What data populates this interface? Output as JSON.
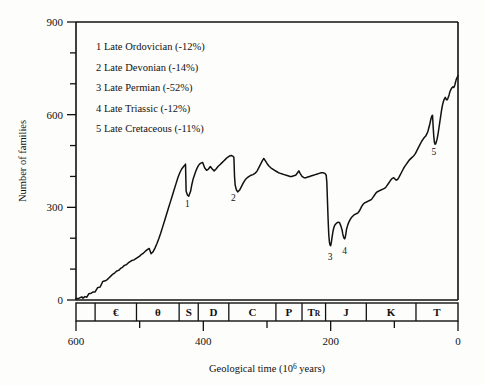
{
  "chart_data": {
    "type": "line",
    "title": "",
    "xlabel": "Geological time (10⁶ years)",
    "ylabel": "Number of families",
    "xlim": [
      600,
      0
    ],
    "ylim": [
      0,
      900
    ],
    "x_ticks": [
      600,
      500,
      400,
      300,
      200,
      100,
      0
    ],
    "x_tick_labels": [
      "600",
      "",
      "400",
      "",
      "200",
      "",
      "0"
    ],
    "x_tick_labels_major": [
      "600",
      "400",
      "200",
      "0"
    ],
    "y_ticks": [
      0,
      100,
      200,
      300,
      400,
      500,
      600,
      700,
      800,
      900
    ],
    "y_tick_labels_major": [
      "0",
      "300",
      "600",
      "900"
    ],
    "grid": false,
    "legend_position": "upper-left-inside",
    "series": [
      {
        "name": "Marine family diversity",
        "color": "#111111",
        "points": [
          [
            600,
            5
          ],
          [
            592,
            8
          ],
          [
            588,
            14
          ],
          [
            584,
            12
          ],
          [
            580,
            22
          ],
          [
            576,
            26
          ],
          [
            572,
            30
          ],
          [
            568,
            30
          ],
          [
            564,
            42
          ],
          [
            560,
            44
          ],
          [
            556,
            62
          ],
          [
            552,
            64
          ],
          [
            548,
            70
          ],
          [
            544,
            80
          ],
          [
            540,
            86
          ],
          [
            536,
            92
          ],
          [
            532,
            98
          ],
          [
            528,
            102
          ],
          [
            524,
            110
          ],
          [
            520,
            112
          ],
          [
            516,
            120
          ],
          [
            512,
            124
          ],
          [
            508,
            130
          ],
          [
            504,
            132
          ],
          [
            500,
            136
          ],
          [
            496,
            140
          ],
          [
            492,
            148
          ],
          [
            488,
            152
          ],
          [
            484,
            158
          ],
          [
            480,
            163
          ],
          [
            476,
            150
          ],
          [
            472,
            156
          ],
          [
            468,
            166
          ],
          [
            464,
            180
          ],
          [
            460,
            196
          ],
          [
            456,
            214
          ],
          [
            452,
            232
          ],
          [
            448,
            252
          ],
          [
            444,
            272
          ],
          [
            440,
            292
          ],
          [
            436,
            312
          ],
          [
            432,
            332
          ],
          [
            428,
            352
          ],
          [
            424,
            372
          ],
          [
            420,
            392
          ],
          [
            416,
            408
          ],
          [
            412,
            420
          ],
          [
            440,
            292
          ],
          [
            408,
            428
          ],
          [
            438,
            300
          ],
          [
            404,
            436
          ],
          [
            400,
            440
          ],
          [
            438,
            304
          ]
        ]
      }
    ],
    "curve_path": [
      [
        600,
        4
      ],
      [
        595,
        6
      ],
      [
        591,
        10
      ],
      [
        589,
        6
      ],
      [
        586,
        11
      ],
      [
        583,
        9
      ],
      [
        580,
        20
      ],
      [
        576,
        22
      ],
      [
        573,
        26
      ],
      [
        570,
        26
      ],
      [
        566,
        40
      ],
      [
        562,
        42
      ],
      [
        558,
        60
      ],
      [
        554,
        62
      ],
      [
        551,
        66
      ],
      [
        548,
        72
      ],
      [
        545,
        78
      ],
      [
        542,
        84
      ],
      [
        539,
        88
      ],
      [
        536,
        94
      ],
      [
        533,
        96
      ],
      [
        530,
        102
      ],
      [
        527,
        106
      ],
      [
        524,
        112
      ],
      [
        521,
        114
      ],
      [
        518,
        120
      ],
      [
        515,
        124
      ],
      [
        512,
        128
      ],
      [
        509,
        130
      ],
      [
        506,
        134
      ],
      [
        503,
        138
      ],
      [
        500,
        142
      ],
      [
        497,
        148
      ],
      [
        494,
        152
      ],
      [
        491,
        158
      ],
      [
        488,
        163
      ],
      [
        485,
        167
      ],
      [
        482,
        150
      ],
      [
        479,
        156
      ],
      [
        476,
        168
      ],
      [
        473,
        182
      ],
      [
        470,
        198
      ],
      [
        467,
        216
      ],
      [
        464,
        236
      ],
      [
        461,
        256
      ],
      [
        458,
        276
      ],
      [
        455,
        296
      ],
      [
        452,
        316
      ],
      [
        449,
        336
      ],
      [
        446,
        356
      ],
      [
        443,
        376
      ],
      [
        440,
        396
      ],
      [
        437,
        412
      ],
      [
        434,
        424
      ],
      [
        431,
        432
      ],
      [
        429,
        437
      ],
      [
        428,
        440
      ],
      [
        427,
        352
      ],
      [
        425,
        340
      ],
      [
        423,
        336
      ],
      [
        420,
        352
      ],
      [
        418,
        374
      ],
      [
        416,
        392
      ],
      [
        414,
        404
      ],
      [
        412,
        416
      ],
      [
        410,
        426
      ],
      [
        408,
        434
      ],
      [
        406,
        440
      ],
      [
        404,
        443
      ],
      [
        401,
        445
      ],
      [
        398,
        428
      ],
      [
        395,
        420
      ],
      [
        392,
        424
      ],
      [
        389,
        432
      ],
      [
        386,
        424
      ],
      [
        383,
        418
      ],
      [
        380,
        424
      ],
      [
        377,
        432
      ],
      [
        374,
        438
      ],
      [
        371,
        444
      ],
      [
        368,
        450
      ],
      [
        365,
        456
      ],
      [
        362,
        462
      ],
      [
        359,
        466
      ],
      [
        356,
        468
      ],
      [
        354,
        466
      ],
      [
        352,
        462
      ],
      [
        351,
        400
      ],
      [
        350,
        372
      ],
      [
        348,
        356
      ],
      [
        346,
        350
      ],
      [
        343,
        356
      ],
      [
        340,
        368
      ],
      [
        337,
        380
      ],
      [
        334,
        390
      ],
      [
        331,
        396
      ],
      [
        328,
        400
      ],
      [
        325,
        404
      ],
      [
        322,
        406
      ],
      [
        319,
        410
      ],
      [
        316,
        416
      ],
      [
        313,
        428
      ],
      [
        310,
        440
      ],
      [
        307,
        452
      ],
      [
        305,
        458
      ],
      [
        303,
        452
      ],
      [
        300,
        442
      ],
      [
        297,
        434
      ],
      [
        294,
        428
      ],
      [
        291,
        424
      ],
      [
        288,
        420
      ],
      [
        285,
        416
      ],
      [
        282,
        412
      ],
      [
        279,
        410
      ],
      [
        276,
        408
      ],
      [
        273,
        406
      ],
      [
        270,
        404
      ],
      [
        267,
        402
      ],
      [
        264,
        400
      ],
      [
        261,
        400
      ],
      [
        258,
        402
      ],
      [
        255,
        404
      ],
      [
        252,
        412
      ],
      [
        250,
        418
      ],
      [
        248,
        410
      ],
      [
        245,
        400
      ],
      [
        242,
        396
      ],
      [
        239,
        396
      ],
      [
        236,
        398
      ],
      [
        233,
        400
      ],
      [
        230,
        402
      ],
      [
        227,
        404
      ],
      [
        224,
        406
      ],
      [
        221,
        408
      ],
      [
        218,
        410
      ],
      [
        215,
        412
      ],
      [
        212,
        412
      ],
      [
        209,
        410
      ],
      [
        207,
        404
      ],
      [
        206,
        380
      ],
      [
        205,
        320
      ],
      [
        204,
        260
      ],
      [
        203,
        212
      ],
      [
        202,
        188
      ],
      [
        201,
        178
      ],
      [
        200,
        176
      ],
      [
        199,
        186
      ],
      [
        198,
        200
      ],
      [
        197,
        214
      ],
      [
        196,
        226
      ],
      [
        195,
        234
      ],
      [
        194,
        240
      ],
      [
        193,
        244
      ],
      [
        192,
        246
      ],
      [
        190,
        250
      ],
      [
        188,
        252
      ],
      [
        186,
        250
      ],
      [
        184,
        240
      ],
      [
        182,
        226
      ],
      [
        181,
        214
      ],
      [
        180,
        206
      ],
      [
        179,
        200
      ],
      [
        178,
        198
      ],
      [
        177,
        204
      ],
      [
        176,
        216
      ],
      [
        175,
        230
      ],
      [
        173,
        244
      ],
      [
        171,
        254
      ],
      [
        169,
        262
      ],
      [
        167,
        268
      ],
      [
        165,
        272
      ],
      [
        163,
        276
      ],
      [
        161,
        278
      ],
      [
        159,
        280
      ],
      [
        157,
        282
      ],
      [
        155,
        288
      ],
      [
        153,
        296
      ],
      [
        151,
        304
      ],
      [
        149,
        310
      ],
      [
        147,
        314
      ],
      [
        145,
        316
      ],
      [
        143,
        318
      ],
      [
        141,
        320
      ],
      [
        139,
        322
      ],
      [
        137,
        324
      ],
      [
        135,
        328
      ],
      [
        133,
        334
      ],
      [
        131,
        340
      ],
      [
        129,
        346
      ],
      [
        127,
        350
      ],
      [
        125,
        352
      ],
      [
        123,
        354
      ],
      [
        121,
        356
      ],
      [
        119,
        358
      ],
      [
        117,
        360
      ],
      [
        115,
        362
      ],
      [
        113,
        366
      ],
      [
        111,
        372
      ],
      [
        109,
        378
      ],
      [
        107,
        384
      ],
      [
        105,
        390
      ],
      [
        103,
        394
      ],
      [
        101,
        396
      ],
      [
        99,
        392
      ],
      [
        97,
        388
      ],
      [
        95,
        390
      ],
      [
        93,
        396
      ],
      [
        91,
        404
      ],
      [
        89,
        412
      ],
      [
        87,
        420
      ],
      [
        85,
        428
      ],
      [
        83,
        434
      ],
      [
        81,
        440
      ],
      [
        79,
        446
      ],
      [
        77,
        452
      ],
      [
        75,
        456
      ],
      [
        73,
        460
      ],
      [
        71,
        464
      ],
      [
        69,
        468
      ],
      [
        67,
        474
      ],
      [
        65,
        482
      ],
      [
        63,
        490
      ],
      [
        61,
        498
      ],
      [
        59,
        506
      ],
      [
        57,
        514
      ],
      [
        55,
        520
      ],
      [
        53,
        526
      ],
      [
        51,
        530
      ],
      [
        50,
        534
      ],
      [
        49,
        538
      ],
      [
        48,
        542
      ],
      [
        47,
        548
      ],
      [
        46,
        556
      ],
      [
        45,
        564
      ],
      [
        44,
        572
      ],
      [
        43,
        582
      ],
      [
        42,
        590
      ],
      [
        41,
        596
      ],
      [
        40,
        598
      ],
      [
        39,
        560
      ],
      [
        38,
        528
      ],
      [
        37,
        510
      ],
      [
        36,
        504
      ],
      [
        35,
        506
      ],
      [
        34,
        512
      ],
      [
        33,
        520
      ],
      [
        32,
        530
      ],
      [
        31,
        542
      ],
      [
        30,
        556
      ],
      [
        29,
        570
      ],
      [
        28,
        584
      ],
      [
        27,
        598
      ],
      [
        26,
        612
      ],
      [
        25,
        624
      ],
      [
        24,
        634
      ],
      [
        23,
        642
      ],
      [
        22,
        648
      ],
      [
        21,
        652
      ],
      [
        20,
        656
      ],
      [
        19,
        652
      ],
      [
        18,
        648
      ],
      [
        17,
        648
      ],
      [
        16,
        652
      ],
      [
        15,
        658
      ],
      [
        14,
        664
      ],
      [
        13,
        672
      ],
      [
        12,
        678
      ],
      [
        11,
        682
      ],
      [
        10,
        686
      ],
      [
        9,
        688
      ],
      [
        8,
        690
      ],
      [
        7,
        688
      ],
      [
        6,
        690
      ],
      [
        5,
        696
      ],
      [
        4,
        704
      ],
      [
        3,
        712
      ],
      [
        2,
        718
      ],
      [
        1,
        722
      ],
      [
        0,
        726
      ]
    ],
    "annotations": [
      {
        "id": "1",
        "label": "1",
        "x": 425,
        "y": 300,
        "event": "Late Ordovician"
      },
      {
        "id": "2",
        "label": "2",
        "x": 353,
        "y": 320,
        "event": "Late Devonian"
      },
      {
        "id": "3",
        "label": "3",
        "x": 201,
        "y": 130,
        "event": "Late Permian"
      },
      {
        "id": "4",
        "label": "4",
        "x": 178,
        "y": 150,
        "event": "Late Triassic"
      },
      {
        "id": "5",
        "label": "5",
        "x": 38,
        "y": 470,
        "event": "Late Cretaceous"
      }
    ],
    "legend_entries": [
      "1 Late Ordovician (-12%)",
      "2 Late Devonian (-14%)",
      "3 Late Permian (-52%)",
      "4 Late Triassic (-12%)",
      "5 Late Cretaceous (-11%)"
    ],
    "geological_periods": [
      {
        "symbol": "",
        "start": 600,
        "end": 570,
        "label": ""
      },
      {
        "symbol": "€",
        "start": 570,
        "end": 505,
        "label": "Cambrian"
      },
      {
        "symbol": "θ",
        "start": 505,
        "end": 438,
        "label": "Ordovician"
      },
      {
        "symbol": "S",
        "start": 438,
        "end": 408,
        "label": "Silurian"
      },
      {
        "symbol": "D",
        "start": 408,
        "end": 360,
        "label": "Devonian"
      },
      {
        "symbol": "C",
        "start": 360,
        "end": 286,
        "label": "Carboniferous"
      },
      {
        "symbol": "P",
        "start": 286,
        "end": 245,
        "label": "Permian"
      },
      {
        "symbol": "TR",
        "start": 245,
        "end": 208,
        "label": "Triassic"
      },
      {
        "symbol": "J",
        "start": 208,
        "end": 144,
        "label": "Jurassic"
      },
      {
        "symbol": "K",
        "start": 144,
        "end": 66,
        "label": "Cretaceous"
      },
      {
        "symbol": "T",
        "start": 66,
        "end": 0,
        "label": "Tertiary"
      }
    ]
  },
  "axes": {
    "y_label": "Number of families",
    "x_label_main": "Geological time (10",
    "x_label_sup": "6",
    "x_label_tail": " years)"
  },
  "colors": {
    "background": "#fdfdfb",
    "line": "#111111",
    "axis": "#111111"
  }
}
